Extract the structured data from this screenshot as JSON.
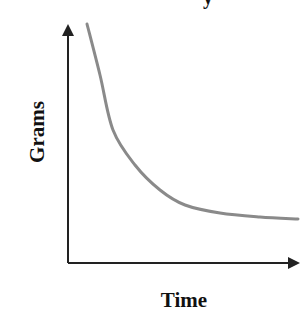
{
  "chart_data": {
    "type": "line",
    "title": "",
    "xlabel": "Time",
    "ylabel": "Grams",
    "grid": false,
    "legend": null,
    "axes": {
      "x_ticks": [],
      "y_ticks": [],
      "arrows": true
    },
    "series": [
      {
        "name": "decay curve",
        "color": "#8a8a8a",
        "shape": "exponential decay approaching horizontal asymptote",
        "points_px": [
          [
            87,
            24
          ],
          [
            100,
            75
          ],
          [
            113,
            130
          ],
          [
            135,
            165
          ],
          [
            160,
            190
          ],
          [
            185,
            205
          ],
          [
            220,
            213
          ],
          [
            260,
            217
          ],
          [
            298,
            219
          ]
        ]
      }
    ]
  },
  "labels": {
    "title_fragment": "y",
    "x": "Time",
    "y": "Grams"
  },
  "colors": {
    "axis": "#222222",
    "curve": "#8a8a8a",
    "text": "#111111"
  }
}
